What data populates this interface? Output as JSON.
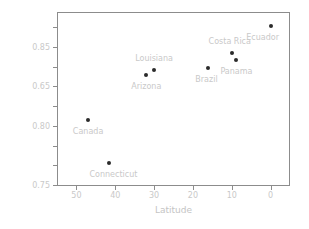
{
  "chart_data": {
    "type": "scatter",
    "title": "",
    "xlabel": "Latitude",
    "ylabel": "Turnover between host plants (β)",
    "xlim": [
      55,
      -5
    ],
    "ylim": [
      0.74,
      0.89
    ],
    "x_ticks": [
      {
        "value": 50,
        "label": "50"
      },
      {
        "value": 40,
        "label": "40"
      },
      {
        "value": 30,
        "label": "30"
      },
      {
        "value": 20,
        "label": "20"
      },
      {
        "value": 10,
        "label": "10"
      },
      {
        "value": 0,
        "label": "0"
      }
    ],
    "y_ticks": [
      {
        "value": 0.885,
        "label": ""
      },
      {
        "value": 0.86,
        "label": "0.85"
      },
      {
        "value": 0.835,
        "label": ""
      },
      {
        "value": 0.81,
        "label": ""
      },
      {
        "value": 0.785,
        "label": "0.65"
      },
      {
        "value": 0.785,
        "label": ""
      },
      {
        "value": 0.785,
        "label": "0.80"
      },
      {
        "value": 0.76,
        "label": ""
      },
      {
        "value": 0.745,
        "label": "0.75"
      }
    ],
    "y_tick_labels_visible": [
      "0.85",
      "0.65",
      "0.80",
      "0.75"
    ],
    "grid": false,
    "legend": false,
    "marker": {
      "shape": "circle",
      "color": "#2b2b2b",
      "size": 4
    },
    "label_color": "#c9c9c9",
    "points": [
      {
        "name": "Canada",
        "x": 47.0,
        "y": 0.797,
        "label_dx": 0,
        "label_dy": 7,
        "label_anchor": "center"
      },
      {
        "name": "Connecticut",
        "x": 41.5,
        "y": 0.76,
        "label_dx": 4,
        "label_dy": 7,
        "label_anchor": "center"
      },
      {
        "name": "Arizona",
        "x": 32.0,
        "y": 0.836,
        "label_dx": 0,
        "label_dy": 7,
        "label_anchor": "center"
      },
      {
        "name": "Louisiana",
        "x": 30.0,
        "y": 0.84,
        "label_dx": 0,
        "label_dy": -16,
        "label_anchor": "center"
      },
      {
        "name": "Brazil",
        "x": 16.0,
        "y": 0.842,
        "label_dx": -2,
        "label_dy": 7,
        "label_anchor": "center"
      },
      {
        "name": "Costa Rica",
        "x": 10.0,
        "y": 0.855,
        "label_dx": -2,
        "label_dy": -16,
        "label_anchor": "center"
      },
      {
        "name": "Panama",
        "x": 8.8,
        "y": 0.849,
        "label_dx": 0,
        "label_dy": 7,
        "label_anchor": "center"
      },
      {
        "name": "Ecuador",
        "x": 0.0,
        "y": 0.878,
        "label_dx": -8,
        "label_dy": 7,
        "label_anchor": "center"
      }
    ]
  }
}
